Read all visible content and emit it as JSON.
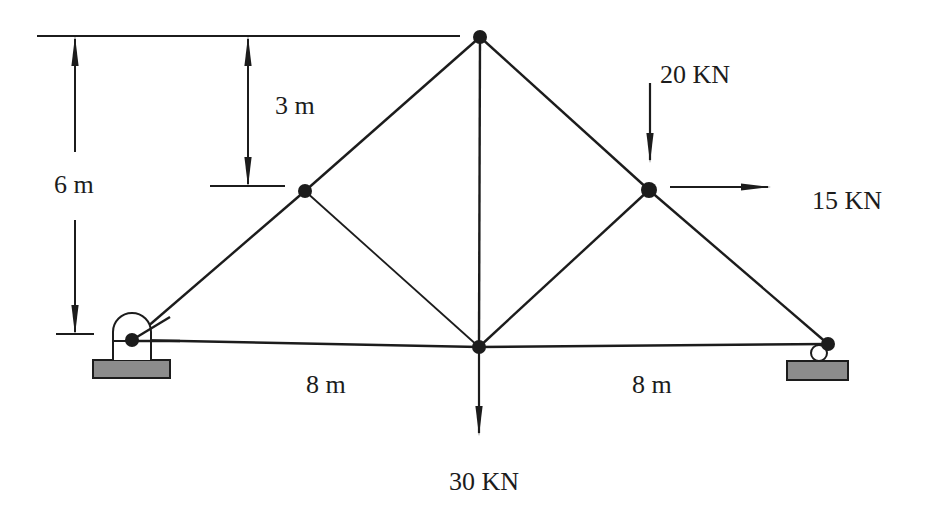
{
  "diagram": {
    "dimensions": {
      "total_height": "6 m",
      "upper_height": "3 m",
      "left_span": "8 m",
      "right_span": "8 m"
    },
    "loads": {
      "vertical_top_right": "20 KN",
      "horizontal_right": "15 KN",
      "vertical_bottom_center": "30 KN"
    },
    "supports": {
      "left": "pin-support",
      "right": "roller-support"
    },
    "nodes": [
      {
        "id": "A",
        "x": 132,
        "y": 340
      },
      {
        "id": "B",
        "x": 305,
        "y": 191
      },
      {
        "id": "C",
        "x": 480,
        "y": 37
      },
      {
        "id": "D",
        "x": 649,
        "y": 190
      },
      {
        "id": "E",
        "x": 828,
        "y": 344
      },
      {
        "id": "F",
        "x": 479,
        "y": 347
      }
    ],
    "colors": {
      "line": "#1c1c1c",
      "support_fill": "#8c8c8c"
    }
  }
}
